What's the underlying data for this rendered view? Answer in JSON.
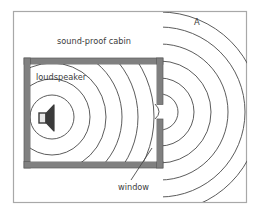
{
  "figure": {
    "background_color": "#ffffff",
    "frame": {
      "name": "outer-frame",
      "color": "#a8a8a8",
      "x": 13,
      "y": 11,
      "width": 234,
      "height": 192
    }
  },
  "labels": {
    "cabin": "sound-proof cabin",
    "loudspeaker": "loudspeaker",
    "window": "window",
    "point_a": "A"
  },
  "cabin": {
    "name": "sound-proof-cabin",
    "wall_color": "#808080",
    "wall_edge_color": "#585858",
    "interior_color": "#ffffff",
    "x": 24,
    "y": 58,
    "width": 139,
    "height": 110,
    "wall_thickness": 6
  },
  "window_opening": {
    "name": "window-opening",
    "y_top": 104,
    "y_bottom": 119
  },
  "loudspeaker": {
    "name": "loudspeaker-icon",
    "color": "#3a3a3a",
    "x": 40,
    "y": 110
  },
  "waves": {
    "color": "#4a4a4a",
    "stroke_width": 0.9,
    "inside": {
      "origin_x": 52,
      "origin_y": 117,
      "radii": [
        22,
        38,
        54,
        70,
        86,
        102
      ],
      "count": 6
    },
    "outside": {
      "origin_x": 160,
      "origin_y": 112,
      "radii": [
        18,
        34,
        51,
        68,
        85,
        100
      ],
      "count": 6
    }
  },
  "leader_line": {
    "name": "window-leader-line",
    "color": "#4a4a4a",
    "from_x": 131,
    "from_y": 180,
    "to_x": 152,
    "to_y": 148
  }
}
